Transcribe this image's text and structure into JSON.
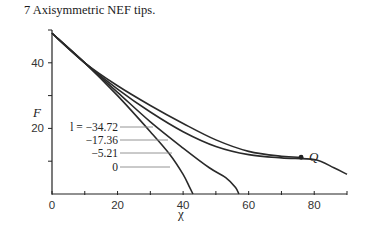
{
  "caption": "7  Axisymmetric NEF tips.",
  "chart_data": {
    "type": "line",
    "title": "7  Axisymmetric NEF tips.",
    "xlabel": "χ",
    "ylabel": "F",
    "xlim": [
      0,
      90
    ],
    "ylim": [
      0,
      50
    ],
    "x_ticks": [
      0,
      20,
      40,
      60,
      80
    ],
    "x_minor_ticks": [
      10,
      30,
      50,
      70,
      90
    ],
    "y_ticks": [
      20,
      40
    ],
    "y_minor_ticks": [
      10,
      30,
      50
    ],
    "grid": false,
    "legend": "inline leader-line labels",
    "label_prefix": "l =",
    "series": [
      {
        "name": "-34.72",
        "label": "l = −34.72",
        "end_marker": "Q",
        "x": [
          0,
          10,
          20,
          30,
          40,
          50,
          60,
          70,
          76
        ],
        "y": [
          49,
          40,
          33,
          27,
          21.5,
          16.5,
          13,
          11.5,
          11.2
        ]
      },
      {
        "name": "-17.36",
        "label": "−17.36",
        "x": [
          0,
          10,
          20,
          30,
          40,
          50,
          60,
          70,
          80,
          86,
          90
        ],
        "y": [
          49,
          40,
          32,
          25,
          19,
          14.5,
          12,
          11,
          10.5,
          8,
          6
        ]
      },
      {
        "name": "-5.21",
        "label": "−5.21",
        "x": [
          0,
          10,
          20,
          30,
          40,
          48,
          53,
          56,
          57
        ],
        "y": [
          49,
          40,
          31,
          22,
          14,
          8,
          5,
          2,
          0
        ]
      },
      {
        "name": "0",
        "label": "0",
        "x": [
          0,
          10,
          20,
          30,
          36,
          40,
          42,
          43
        ],
        "y": [
          49,
          40,
          30,
          19,
          12,
          6,
          2,
          0
        ]
      }
    ],
    "annotations": [
      {
        "text": "Q",
        "x": 76,
        "y": 11.2,
        "marker": "dot"
      }
    ]
  },
  "labels": {
    "y_axis": "F",
    "x_axis": "χ",
    "x_tick_labels": [
      "0",
      "20",
      "40",
      "60",
      "80"
    ],
    "y_tick_labels": [
      "20",
      "40"
    ],
    "series_labels": [
      "l = −34.72",
      "−17.36",
      "−5.21",
      "0"
    ],
    "q_label": "Q"
  }
}
